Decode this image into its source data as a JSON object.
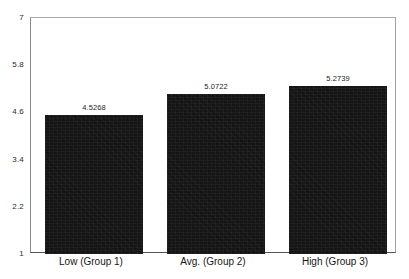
{
  "chart_data": {
    "type": "bar",
    "title": "",
    "subtitle": "",
    "xlabel": "",
    "ylabel": "",
    "categories": [
      "Low (Group 1)",
      "Avg. (Group 2)",
      "High (Group 3)"
    ],
    "values": [
      4.5268,
      5.0722,
      5.2739
    ],
    "value_labels": [
      "4.5268",
      "5.0722",
      "5.2739"
    ],
    "ylim": [
      1,
      7
    ],
    "ytick_values": [
      1,
      2.2,
      3.4,
      4.6,
      5.8,
      7
    ],
    "ytick_labels": [
      "1",
      "2.2",
      "3.4",
      "4.6",
      "5.8",
      "7"
    ],
    "grid": false,
    "legend": false,
    "legend_position": "none",
    "bar_color": "#141414",
    "frame_color": "#8a8a8a",
    "baseline_color": "#555555",
    "text_color": "#1e1e1e"
  }
}
